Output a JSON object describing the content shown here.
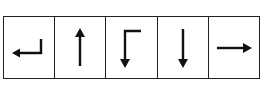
{
  "diagram": {
    "title": "",
    "stroke_color": "#111111",
    "border_color": "#222222",
    "cells": [
      {
        "index": 0,
        "icon": "return-left-arrow-icon",
        "description": "Arrow going left then up (enter/return key)"
      },
      {
        "index": 1,
        "icon": "up-arrow-icon",
        "description": "Arrow pointing up"
      },
      {
        "index": 2,
        "icon": "right-then-down-arrow-icon",
        "description": "Arrow from top-right going left then down"
      },
      {
        "index": 3,
        "icon": "down-arrow-icon",
        "description": "Arrow pointing down"
      },
      {
        "index": 4,
        "icon": "right-arrow-icon",
        "description": "Arrow pointing right"
      }
    ]
  }
}
